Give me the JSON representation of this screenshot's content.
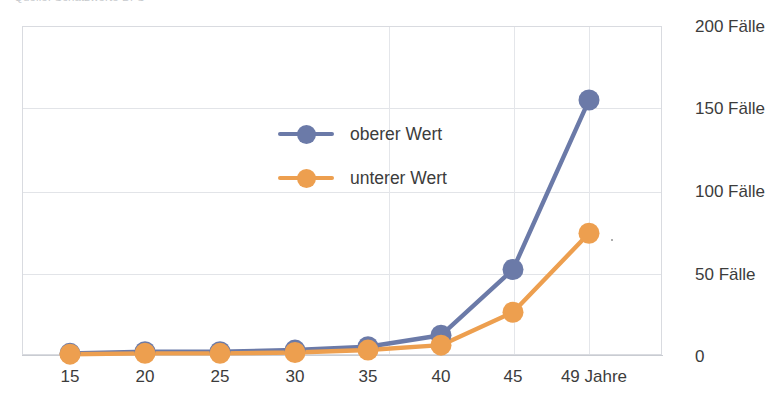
{
  "chart": {
    "title": "Quelle: Schätzwerte BFS",
    "ylabel_suffix": "Fälle"
  },
  "legend": {
    "position": "inside-upper-left",
    "items": [
      {
        "label": "oberer Wert",
        "color": "#6B7AA8",
        "marker": "circle"
      },
      {
        "label": "unterer Wert",
        "color": "#ED9F4F",
        "marker": "circle"
      }
    ]
  },
  "axis": {
    "y_ticks": [
      "0",
      "50 Fälle",
      "100 Fälle",
      "150 Fälle",
      "200 Fälle"
    ],
    "x_ticks": [
      "15",
      "20",
      "25",
      "30",
      "35",
      "40",
      "45",
      "49 Jahre"
    ]
  },
  "chart_data": {
    "type": "line",
    "title": "Quelle: Schätzwerte BFS",
    "xlabel": "",
    "ylabel": "Fälle",
    "categories": [
      "15",
      "20",
      "25",
      "30",
      "35",
      "40",
      "45",
      "49 Jahre"
    ],
    "ylim": [
      0,
      200
    ],
    "yticks": [
      0,
      50,
      100,
      150,
      200
    ],
    "ytick_labels": [
      "0",
      "50 Fälle",
      "100 Fälle",
      "150 Fälle",
      "200 Fälle"
    ],
    "grid": true,
    "legend_position": "inside upper left",
    "series": [
      {
        "name": "oberer Wert",
        "color": "#6B7AA8",
        "values": [
          1,
          2,
          2,
          3,
          5,
          12,
          52,
          155
        ]
      },
      {
        "name": "unterer Wert",
        "color": "#ED9F4F",
        "values": [
          0.5,
          1,
          1,
          1.5,
          3,
          6,
          26,
          74
        ]
      }
    ]
  },
  "geometry": {
    "plot": {
      "left": 22,
      "top": 26,
      "right": 662,
      "bottom": 355
    },
    "x_positions": [
      70,
      145,
      220,
      295,
      368,
      441,
      513,
      589
    ],
    "y_gridlines": [
      355,
      273,
      191,
      107,
      26
    ]
  }
}
